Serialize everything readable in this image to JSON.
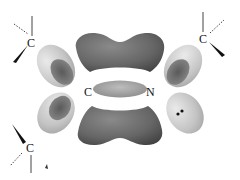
{
  "diagram": {
    "type": "molecular-orbital-surface",
    "atoms": {
      "carbon_center": "C",
      "nitrogen_center": "N",
      "substituent_top_left": "C",
      "substituent_top_right": "C",
      "substituent_bottom_left": "C"
    },
    "lone_pair": "••",
    "colors": {
      "dark_lobe": "#6e6e6e",
      "dark_lobe_shade": "#4a4a4a",
      "light_lobe": "#c8c8c8",
      "light_lobe_inner": "#7a7a7a",
      "bond_line": "#222222",
      "background": "#ffffff"
    }
  }
}
